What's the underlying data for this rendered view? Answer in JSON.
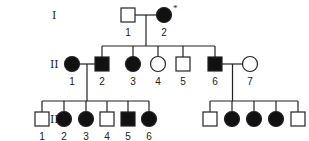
{
  "colors": {
    "affected": "#111111",
    "unaffected": "#ffffff",
    "line": "#222222"
  },
  "generations": [
    {
      "label": "I",
      "y": 15,
      "individuals": [
        {
          "id": "I-1",
          "num": "1",
          "sex": "male",
          "affected": false,
          "x": 128
        },
        {
          "id": "I-2",
          "num": "2",
          "sex": "female",
          "affected": true,
          "x": 164,
          "marker": "*"
        }
      ]
    },
    {
      "label": "II",
      "y": 64,
      "individuals": [
        {
          "id": "II-1",
          "num": "1",
          "sex": "female",
          "affected": true,
          "x": 72
        },
        {
          "id": "II-2",
          "num": "2",
          "sex": "male",
          "affected": true,
          "x": 102
        },
        {
          "id": "II-3",
          "num": "3",
          "sex": "female",
          "affected": true,
          "x": 133
        },
        {
          "id": "II-4",
          "num": "4",
          "sex": "female",
          "affected": false,
          "x": 158
        },
        {
          "id": "II-5",
          "num": "5",
          "sex": "male",
          "affected": false,
          "x": 183
        },
        {
          "id": "II-6",
          "num": "6",
          "sex": "male",
          "affected": true,
          "x": 215
        },
        {
          "id": "II-7",
          "num": "7",
          "sex": "female",
          "affected": false,
          "x": 250
        }
      ]
    },
    {
      "label": "III",
      "y": 119,
      "individuals": [
        {
          "id": "III-1",
          "num": "1",
          "sex": "male",
          "affected": false,
          "x": 42
        },
        {
          "id": "III-2",
          "num": "2",
          "sex": "female",
          "affected": true,
          "x": 64
        },
        {
          "id": "III-3",
          "num": "3",
          "sex": "female",
          "affected": true,
          "x": 86
        },
        {
          "id": "III-4",
          "num": "4",
          "sex": "male",
          "affected": false,
          "x": 107
        },
        {
          "id": "III-5",
          "num": "5",
          "sex": "male",
          "affected": true,
          "x": 128
        },
        {
          "id": "III-6",
          "num": "6",
          "sex": "female",
          "affected": true,
          "x": 149
        },
        {
          "id": "III-7",
          "num": "",
          "sex": "male",
          "affected": false,
          "x": 210
        },
        {
          "id": "III-8",
          "num": "",
          "sex": "female",
          "affected": true,
          "x": 232
        },
        {
          "id": "III-9",
          "num": "",
          "sex": "female",
          "affected": true,
          "x": 254
        },
        {
          "id": "III-10",
          "num": "",
          "sex": "female",
          "affected": true,
          "x": 276
        },
        {
          "id": "III-11",
          "num": "",
          "sex": "male",
          "affected": false,
          "x": 298
        }
      ]
    }
  ],
  "unions": [
    {
      "partners": [
        "I-1",
        "I-2"
      ],
      "children": [
        "II-2",
        "II-3",
        "II-4",
        "II-5",
        "II-6"
      ]
    },
    {
      "partners": [
        "II-1",
        "II-2"
      ],
      "children": [
        "III-1",
        "III-2",
        "III-3",
        "III-4",
        "III-5",
        "III-6"
      ]
    },
    {
      "partners": [
        "II-6",
        "II-7"
      ],
      "children": [
        "III-7",
        "III-8",
        "III-9",
        "III-10",
        "III-11"
      ]
    }
  ]
}
